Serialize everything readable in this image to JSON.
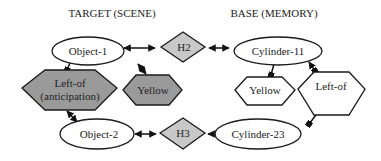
{
  "titles": {
    "target": "TARGET (SCENE)",
    "base": "BASE (MEMORY)"
  },
  "nodes": {
    "object1": {
      "label": "Object-1",
      "shape": "ellipse",
      "fill": "#ffffff"
    },
    "object2": {
      "label": "Object-2",
      "shape": "ellipse",
      "fill": "#ffffff"
    },
    "h2": {
      "label": "H2",
      "shape": "diamond",
      "fill": "#c8c8c8"
    },
    "h3": {
      "label": "H3",
      "shape": "diamond",
      "fill": "#c8c8c8"
    },
    "cylinder11": {
      "label": "Cylinder-11",
      "shape": "ellipse",
      "fill": "#ffffff"
    },
    "cylinder23": {
      "label": "Cylinder-23",
      "shape": "ellipse",
      "fill": "#ffffff"
    },
    "leftof_anticipation": {
      "label_line1": "Left-of",
      "label_line2": "(anticipation)",
      "shape": "hexagon",
      "fill": "#9a9a9a"
    },
    "yellow_target": {
      "label": "Yellow",
      "shape": "hexagon",
      "fill": "#9a9a9a"
    },
    "yellow_base": {
      "label": "Yellow",
      "shape": "hexagon",
      "fill": "#ffffff"
    },
    "leftof_base": {
      "label": "Left-of",
      "shape": "hexagon",
      "fill": "#ffffff"
    }
  },
  "edges": [
    {
      "from": "Object-1",
      "to": "H2",
      "type": "bidirectional"
    },
    {
      "from": "H2",
      "to": "Cylinder-11",
      "type": "bidirectional"
    },
    {
      "from": "Object-2",
      "to": "H3",
      "type": "bidirectional"
    },
    {
      "from": "H3",
      "to": "Cylinder-23",
      "type": "bidirectional"
    },
    {
      "from": "Object-1",
      "to": "Left-of (anticipation)",
      "type": "link"
    },
    {
      "from": "Object-1",
      "to": "Yellow",
      "type": "bidirectional"
    },
    {
      "from": "Left-of (anticipation)",
      "to": "Object-2",
      "type": "bidirectional"
    },
    {
      "from": "Cylinder-11",
      "to": "Yellow",
      "type": "link"
    },
    {
      "from": "Cylinder-11",
      "to": "Left-of",
      "type": "bidirectional"
    },
    {
      "from": "Left-of",
      "to": "Cylinder-23",
      "type": "link"
    }
  ]
}
